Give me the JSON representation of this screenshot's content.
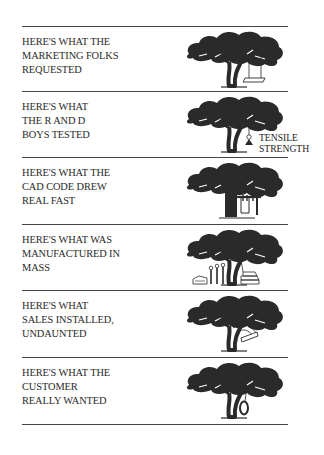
{
  "comic": {
    "panels": [
      {
        "lines": [
          "HERE'S WHAT THE",
          "MARKETING FOLKS",
          "REQUESTED"
        ],
        "illustration": "tree-with-plank-swing"
      },
      {
        "lines": [
          "HERE'S WHAT",
          "THE R AND D",
          "BOYS TESTED"
        ],
        "illustration": "tree-with-weight",
        "annotation": [
          "TENSILE",
          "STRENGTH"
        ]
      },
      {
        "lines": [
          "HERE'S WHAT THE",
          "CAD CODE DREW",
          "REAL FAST"
        ],
        "illustration": "tree-with-frame-swing"
      },
      {
        "lines": [
          "HERE'S WHAT WAS",
          "MANUFACTURED IN",
          "MASS"
        ],
        "illustration": "tree-with-parts-pile"
      },
      {
        "lines": [
          "HERE'S WHAT",
          "SALES INSTALLED,",
          "UNDAUNTED"
        ],
        "illustration": "tree-with-tangled-swing"
      },
      {
        "lines": [
          "HERE'S WHAT THE",
          "CUSTOMER",
          "REALLY WANTED"
        ],
        "illustration": "tree-with-tire-swing"
      }
    ]
  },
  "colors": {
    "ink": "#2a2a2a",
    "rule": "#444444",
    "background": "#ffffff"
  }
}
